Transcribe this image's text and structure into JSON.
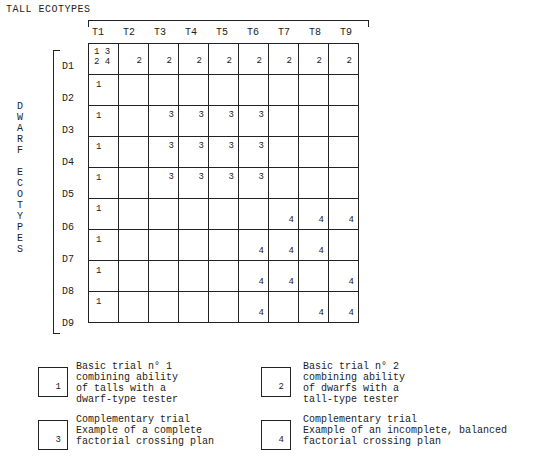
{
  "title": "TALL  ECOTYPES",
  "vertical_label": [
    "D",
    "W",
    "A",
    "R",
    "F",
    "",
    "E",
    "C",
    "O",
    "T",
    "Y",
    "P",
    "E",
    "S"
  ],
  "columns": [
    "T1",
    "T2",
    "T3",
    "T4",
    "T5",
    "T6",
    "T7",
    "T8",
    "T9"
  ],
  "rows": [
    {
      "label": "D1",
      "cells": [
        "1 3|2 4",
        "2",
        "2",
        "2",
        "2",
        "2",
        "2",
        "2",
        "2"
      ]
    },
    {
      "label": "D2",
      "cells": [
        "1",
        "",
        "",
        "",
        "",
        "",
        "",
        "",
        ""
      ]
    },
    {
      "label": "D3",
      "cells": [
        "1",
        "",
        "3",
        "3",
        "3",
        "3",
        "",
        "",
        ""
      ]
    },
    {
      "label": "D4",
      "cells": [
        "1",
        "",
        "3",
        "3",
        "3",
        "3",
        "",
        "",
        ""
      ]
    },
    {
      "label": "D5",
      "cells": [
        "1",
        "",
        "3",
        "3",
        "3",
        "3",
        "",
        "",
        ""
      ]
    },
    {
      "label": "D6",
      "cells": [
        "1",
        "",
        "",
        "",
        "",
        "",
        "4",
        "4",
        "4"
      ]
    },
    {
      "label": "D7",
      "cells": [
        "1",
        "",
        "",
        "",
        "",
        "4",
        "4",
        "4",
        ""
      ]
    },
    {
      "label": "D8",
      "cells": [
        "1",
        "",
        "",
        "",
        "",
        "4",
        "4",
        "",
        "4"
      ]
    },
    {
      "label": "D9",
      "cells": [
        "1",
        "",
        "",
        "",
        "",
        "4",
        "",
        "4",
        "4"
      ]
    }
  ],
  "legend": [
    {
      "code": "1",
      "text": "Basic trial n° 1\ncombining ability\nof talls with a\ndwarf-type tester"
    },
    {
      "code": "2",
      "text": "Basic trial n° 2\ncombining ability\nof dwarfs with a\ntall-type tester"
    },
    {
      "code": "3",
      "text": "Complementary trial\nExample of a complete\nfactorial crossing plan"
    },
    {
      "code": "4",
      "text": "Complementary trial\nExample of an incomplete, balanced\nfactorial crossing plan"
    }
  ]
}
